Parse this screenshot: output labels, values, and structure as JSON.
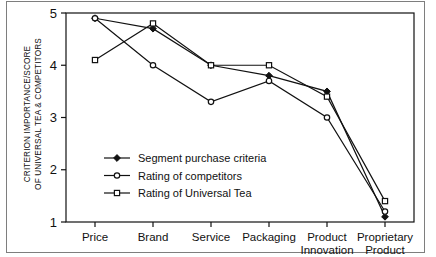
{
  "chart_data": {
    "type": "line",
    "title": "",
    "xlabel": "",
    "ylabel": "CRITERION IMPORTANCE/SCORE OF UNIVERSAL TEA & COMPETITORS",
    "ylabel_line1": "CRITERION IMPORTANCE/SCORE",
    "ylabel_line2": "OF UNIVERSAL TEA & COMPETITORS",
    "categories": [
      "Price",
      "Brand",
      "Service",
      "Packaging",
      "Product Innovation",
      "Proprietary Product"
    ],
    "category_lines": [
      [
        "Price"
      ],
      [
        "Brand"
      ],
      [
        "Service"
      ],
      [
        "Packaging"
      ],
      [
        "Product",
        "Innovation"
      ],
      [
        "Proprietary",
        "Product"
      ]
    ],
    "ylim": [
      1,
      5
    ],
    "yticks": [
      1,
      2,
      3,
      4,
      5
    ],
    "ytick_labels": [
      "1",
      "2",
      "3",
      "4",
      "5"
    ],
    "grid": false,
    "legend_position": "lower-left-inside",
    "series": [
      {
        "name": "Segment purchase criteria",
        "marker": "filled-diamond",
        "values": [
          4.9,
          4.7,
          4.0,
          3.8,
          3.5,
          1.1
        ]
      },
      {
        "name": "Rating of competitors",
        "marker": "open-circle",
        "values": [
          4.9,
          4.0,
          3.3,
          3.7,
          3.0,
          1.2
        ]
      },
      {
        "name": "Rating of Universal Tea",
        "marker": "open-square",
        "values": [
          4.1,
          4.8,
          4.0,
          4.0,
          3.4,
          1.4
        ]
      }
    ],
    "colors": {
      "line": "#111111",
      "axis": "#333333",
      "background": "#ffffff",
      "frame": "#7e7e7e"
    }
  }
}
